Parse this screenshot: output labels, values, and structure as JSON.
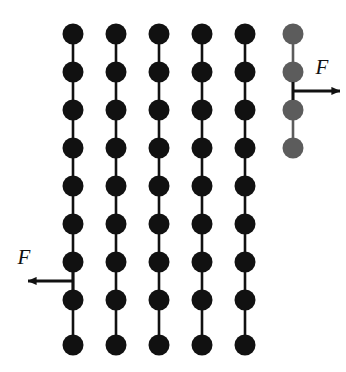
{
  "figure": {
    "background_color": "#ffffff",
    "width": 346,
    "height": 372,
    "bead_radius": 10.5,
    "bond_width": 2.6,
    "colors": {
      "chain_black": "#111111",
      "chain_gray": "#5c5c5c",
      "arrow": "#111111",
      "background": "#ffffff"
    },
    "row_y": [
      34,
      72,
      110,
      148,
      186,
      224,
      262,
      300,
      345
    ],
    "column_x": [
      73,
      116,
      159,
      202,
      245,
      293
    ],
    "chains": [
      {
        "id": "chain-1",
        "x": 73,
        "color": "#111111",
        "bead_count": 9,
        "rows": [
          34,
          72,
          110,
          148,
          186,
          224,
          262,
          300,
          345
        ]
      },
      {
        "id": "chain-2",
        "x": 116,
        "color": "#111111",
        "bead_count": 9,
        "rows": [
          34,
          72,
          110,
          148,
          186,
          224,
          262,
          300,
          345
        ]
      },
      {
        "id": "chain-3",
        "x": 159,
        "color": "#111111",
        "bead_count": 9,
        "rows": [
          34,
          72,
          110,
          148,
          186,
          224,
          262,
          300,
          345
        ]
      },
      {
        "id": "chain-4",
        "x": 202,
        "color": "#111111",
        "bead_count": 9,
        "rows": [
          34,
          72,
          110,
          148,
          186,
          224,
          262,
          300,
          345
        ]
      },
      {
        "id": "chain-5",
        "x": 245,
        "color": "#111111",
        "bead_count": 9,
        "rows": [
          34,
          72,
          110,
          148,
          186,
          224,
          262,
          300,
          345
        ]
      },
      {
        "id": "chain-6",
        "x": 293,
        "color": "#5c5c5c",
        "bead_count": 4,
        "rows": [
          34,
          72,
          110,
          148
        ]
      }
    ],
    "forces": [
      {
        "id": "force-right",
        "label": "F",
        "direction": "right",
        "applied_to_chain": "chain-6",
        "anchor_x": 293,
        "anchor_y": 91,
        "tip_x": 340,
        "label_x": 322,
        "label_y": 74
      },
      {
        "id": "force-left",
        "label": "F",
        "direction": "left",
        "applied_to_chain": "chain-1",
        "anchor_x": 73,
        "anchor_y": 281,
        "tip_x": 28,
        "label_x": 24,
        "label_y": 264
      }
    ]
  }
}
